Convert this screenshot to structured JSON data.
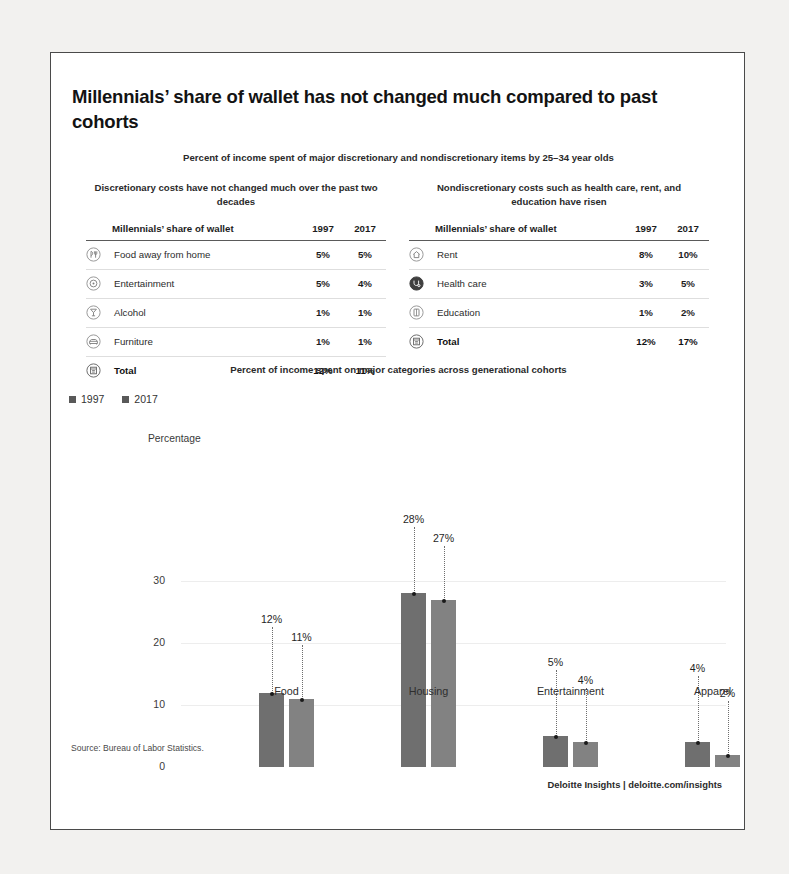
{
  "card": {
    "title": "Millennials’ share of wallet has not changed much compared to past cohorts",
    "main_subtitle": "Percent of income spent of major discretionary and nondiscretionary items by 25–34 year olds",
    "source": "Source: Bureau of Labor Statistics.",
    "brand": "Deloitte Insights | deloitte.com/insights"
  },
  "tables": [
    {
      "heading": "Discretionary costs have not changed much over the past two decades",
      "columns": [
        "Millennials’ share of wallet",
        "1997",
        "2017"
      ],
      "rows": [
        {
          "icon": "food-icon",
          "label": "Food away from home",
          "v1997": "5%",
          "v2017": "5%"
        },
        {
          "icon": "entertainment-icon",
          "label": "Entertainment",
          "v1997": "5%",
          "v2017": "4%"
        },
        {
          "icon": "alcohol-icon",
          "label": "Alcohol",
          "v1997": "1%",
          "v2017": "1%"
        },
        {
          "icon": "furniture-icon",
          "label": "Furniture",
          "v1997": "1%",
          "v2017": "1%"
        },
        {
          "icon": "total-icon",
          "label": "Total",
          "v1997": "12%",
          "v2017": "11%",
          "total": true
        }
      ]
    },
    {
      "heading": "Nondiscretionary costs such as health care, rent, and education have risen",
      "columns": [
        "Millennials’ share of wallet",
        "1997",
        "2017"
      ],
      "rows": [
        {
          "icon": "home-icon",
          "label": "Rent",
          "v1997": "8%",
          "v2017": "10%"
        },
        {
          "icon": "health-care-icon",
          "label": "Health care",
          "v1997": "3%",
          "v2017": "5%"
        },
        {
          "icon": "education-icon",
          "label": "Education",
          "v1997": "1%",
          "v2017": "2%"
        },
        {
          "icon": "total-icon",
          "label": "Total",
          "v1997": "12%",
          "v2017": "17%",
          "total": true
        }
      ]
    }
  ],
  "chart_data": {
    "type": "bar",
    "title": "Percent of income spent on major categories across generational cohorts",
    "xlabel": "",
    "ylabel": "Percentage",
    "ylim": [
      0,
      32
    ],
    "yticks": [
      0,
      10,
      20,
      30
    ],
    "grid": true,
    "legend_position": "top-left",
    "categories": [
      "Food",
      "Housing",
      "Entertainment",
      "Apparel"
    ],
    "series": [
      {
        "name": "1997",
        "color": "#6f6f6f",
        "values": [
          12,
          28,
          5,
          4
        ],
        "labels": [
          "12%",
          "28%",
          "5%",
          "4%"
        ]
      },
      {
        "name": "2017",
        "color": "#828282",
        "values": [
          11,
          27,
          4,
          2
        ],
        "labels": [
          "11%",
          "27%",
          "4%",
          "2%"
        ]
      }
    ]
  }
}
